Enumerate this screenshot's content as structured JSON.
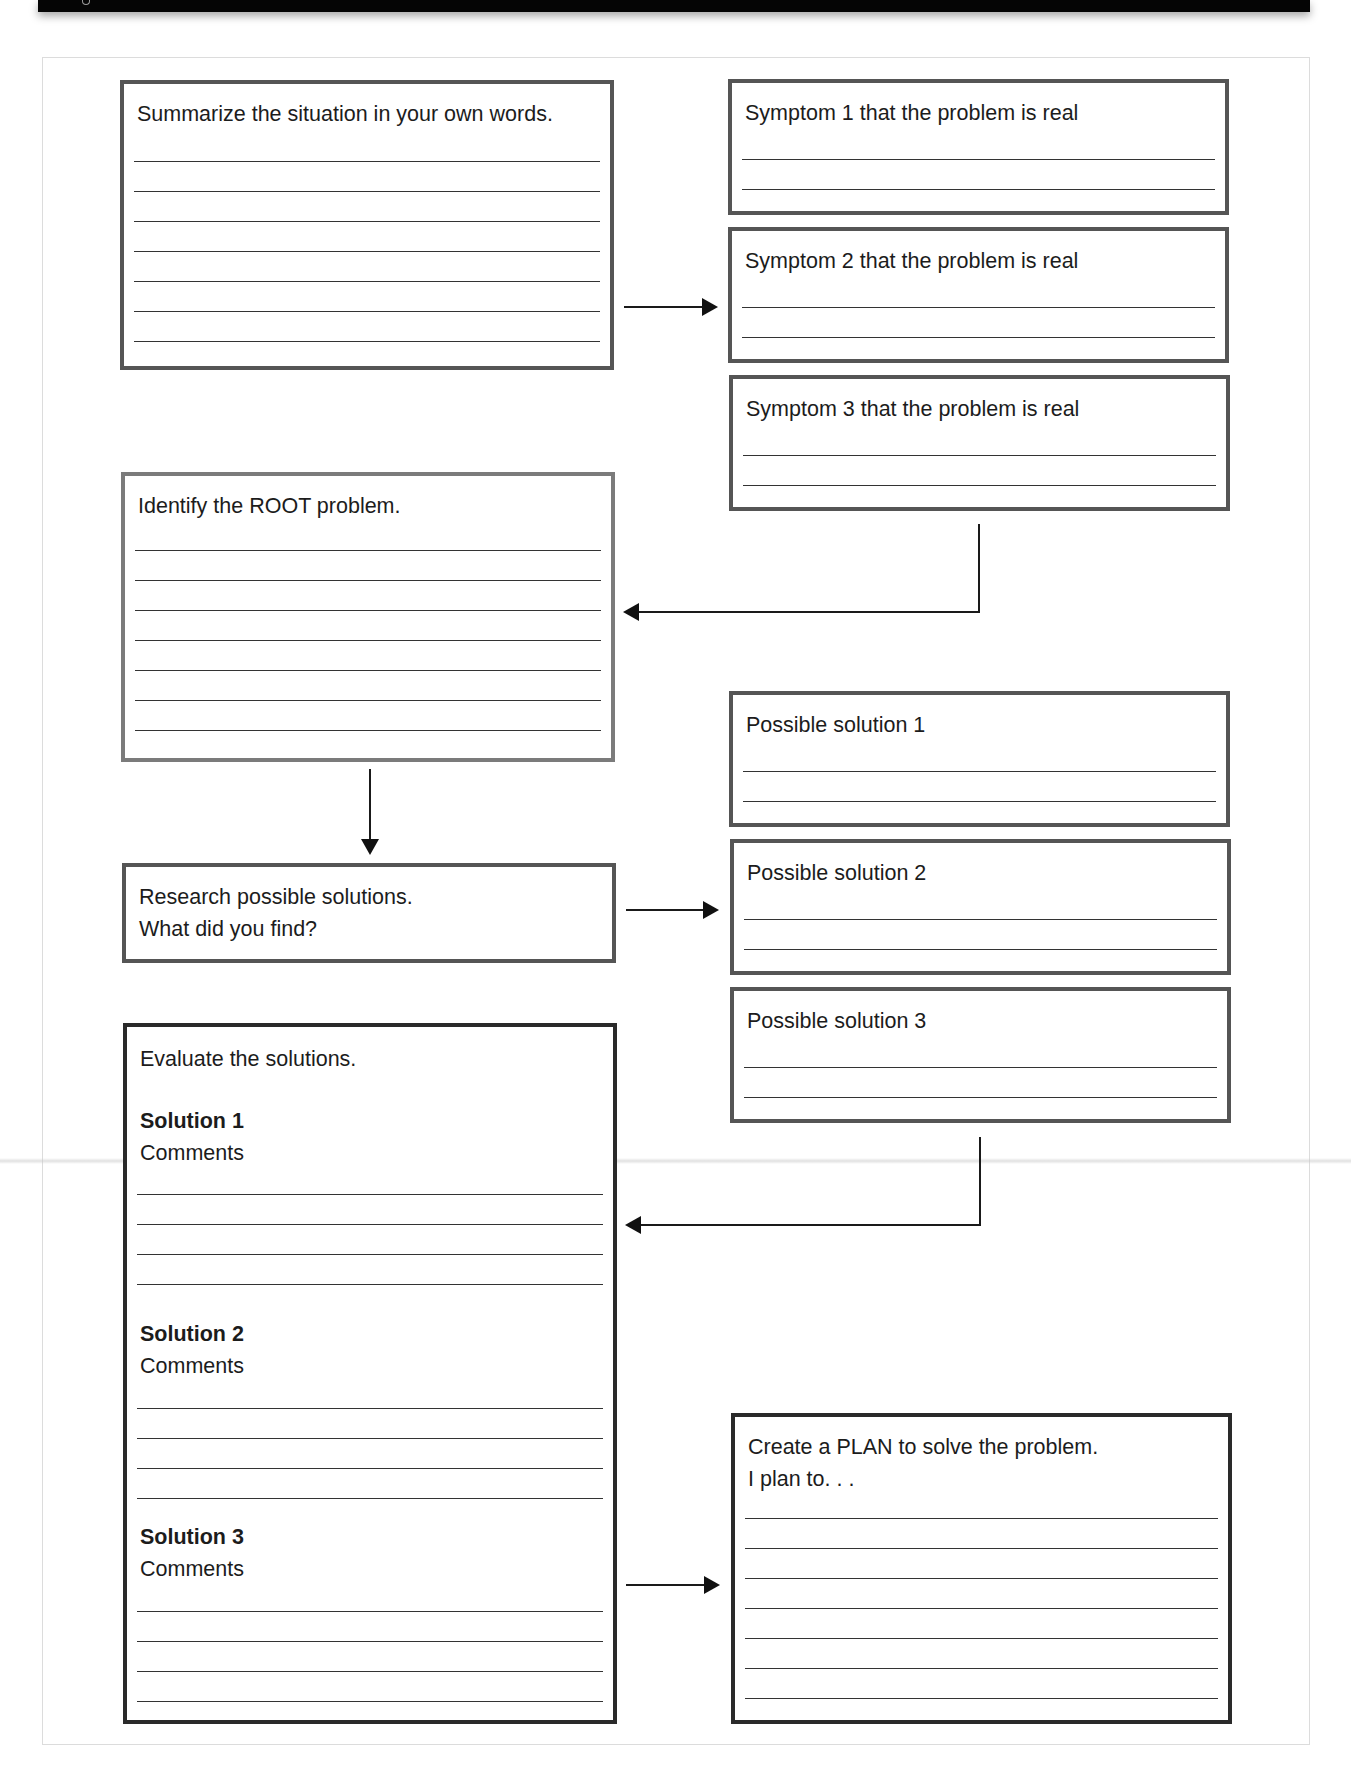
{
  "worksheet": {
    "summarize": {
      "prompt": "Summarize the situation in your own words.",
      "line_count": 7
    },
    "symptoms": [
      {
        "prompt": "Symptom 1 that the problem is real",
        "line_count": 2
      },
      {
        "prompt": "Symptom 2 that the problem is real",
        "line_count": 2
      },
      {
        "prompt": "Symptom 3 that the problem is real",
        "line_count": 2
      }
    ],
    "root_problem": {
      "prompt": "Identify the ROOT problem.",
      "line_count": 7
    },
    "research": {
      "prompt_line1": "Research possible solutions.",
      "prompt_line2": "What did you find?"
    },
    "possible_solutions": [
      {
        "prompt": "Possible solution 1",
        "line_count": 2
      },
      {
        "prompt": "Possible solution 2",
        "line_count": 2
      },
      {
        "prompt": "Possible solution 3",
        "line_count": 2
      }
    ],
    "evaluate": {
      "prompt": "Evaluate the solutions.",
      "sections": [
        {
          "heading": "Solution 1",
          "label": "Comments",
          "line_count": 4
        },
        {
          "heading": "Solution 2",
          "label": "Comments",
          "line_count": 4
        },
        {
          "heading": "Solution 3",
          "label": "Comments",
          "line_count": 4
        }
      ]
    },
    "plan": {
      "prompt_line1": "Create a PLAN to solve the problem.",
      "prompt_line2": "I plan to. . .",
      "line_count": 7
    },
    "colors": {
      "header_bar": "#050505",
      "box_border": "#555555",
      "box_border_dark": "#2a2a2a",
      "write_line": "#333333",
      "arrow": "#111111",
      "page_frame": "#dcdcdc"
    }
  }
}
